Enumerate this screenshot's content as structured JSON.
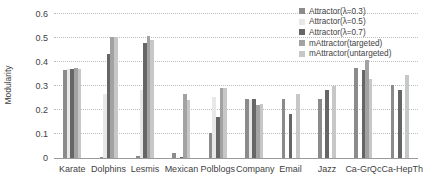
{
  "chart_data": {
    "type": "bar",
    "title": "",
    "xlabel": "",
    "ylabel": "Modularity",
    "ylim": [
      0,
      0.6
    ],
    "ytick_step": 0.1,
    "ytick_labels": [
      "0",
      "0.1",
      "0.2",
      "0.3",
      "0.4",
      "0.5",
      "0.6"
    ],
    "grid": "horizontal-dotted",
    "legend_position": "top-right-inside",
    "categories": [
      "Karate",
      "Dolphins",
      "Lesmis",
      "Mexican",
      "Polblogs",
      "Company",
      "Email",
      "Jazz",
      "Ca-GrQc",
      "Ca-HepTh"
    ],
    "series": [
      {
        "name": "Attractor(λ=0.3)",
        "color": "#8b8b8b",
        "values": [
          0.365,
          0.005,
          0.01,
          0.02,
          0.105,
          0.245,
          0.245,
          0.245,
          0.375,
          0.305
        ]
      },
      {
        "name": "Attractor(λ=0.5)",
        "color": "#e8e8e8",
        "values": [
          0.37,
          0.265,
          0.285,
          0,
          0.255,
          0.24,
          0,
          0,
          0,
          0
        ]
      },
      {
        "name": "Attractor(λ=0.7)",
        "color": "#666666",
        "values": [
          0.37,
          0.435,
          0.48,
          0.005,
          0.17,
          0.245,
          0.185,
          0.285,
          0.365,
          0.285
        ]
      },
      {
        "name": "mAttractor(targeted)",
        "color": "#a2a2a2",
        "values": [
          0.375,
          0.505,
          0.51,
          0.265,
          0.29,
          0.22,
          0,
          0,
          0.41,
          0
        ]
      },
      {
        "name": "mAttractor(untargeted)",
        "color": "#c6c8c7",
        "values": [
          0.37,
          0.505,
          0.49,
          0.24,
          0.29,
          0.225,
          0.265,
          0.3,
          0.33,
          0.345
        ]
      }
    ]
  }
}
